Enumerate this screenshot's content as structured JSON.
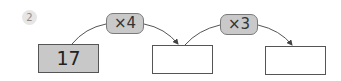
{
  "problem_number": "2",
  "steps": [
    {
      "box_value": "17",
      "filled": true
    },
    {
      "box_value": "",
      "filled": false
    },
    {
      "box_value": "",
      "filled": false
    }
  ],
  "operators": [
    {
      "label": "×4"
    },
    {
      "label": "×3"
    }
  ],
  "colors": {
    "filled_box": "#c8c8c8",
    "pill": "#c9c9c9",
    "circle": "#e6e6e6",
    "stroke": "#555555"
  }
}
